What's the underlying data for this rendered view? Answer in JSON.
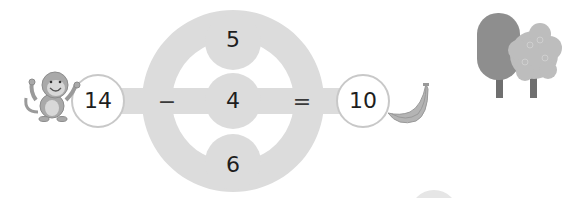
{
  "puzzle": {
    "start_number": "14",
    "operator_left": "−",
    "choices": [
      "5",
      "4",
      "6"
    ],
    "operator_right": "=",
    "result_number": "10"
  },
  "illustrations": {
    "left": "monkey",
    "right_of_result": "banana",
    "top_right": "trees"
  },
  "colors": {
    "track": "#dcdcdc",
    "circle_border": "#c8c8c8",
    "text": "#1e1e1e",
    "background": "#ffffff"
  }
}
